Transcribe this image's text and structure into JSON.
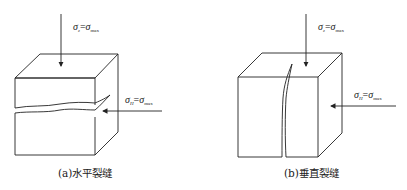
{
  "figure": {
    "panels": [
      {
        "id": "a",
        "caption": "(a)水平裂缝",
        "crack_type": "horizontal",
        "vertical_stress": {
          "symbol": "σ",
          "subscript": "z",
          "equals": "=",
          "rhs_symbol": "σ",
          "rhs_subscript": "max"
        },
        "horizontal_stress": {
          "symbol": "σ",
          "subscript": "H",
          "equals": "=",
          "rhs_symbol": "σ",
          "rhs_subscript": "max"
        }
      },
      {
        "id": "b",
        "caption": "(b)垂直裂缝",
        "crack_type": "vertical",
        "vertical_stress": {
          "symbol": "σ",
          "subscript": "z",
          "equals": "=",
          "rhs_symbol": "σ",
          "rhs_subscript": "max"
        },
        "horizontal_stress": {
          "symbol": "σ",
          "subscript": "H",
          "equals": "=",
          "rhs_symbol": "σ",
          "rhs_subscript": "max"
        }
      }
    ],
    "line_color": "#222222"
  }
}
